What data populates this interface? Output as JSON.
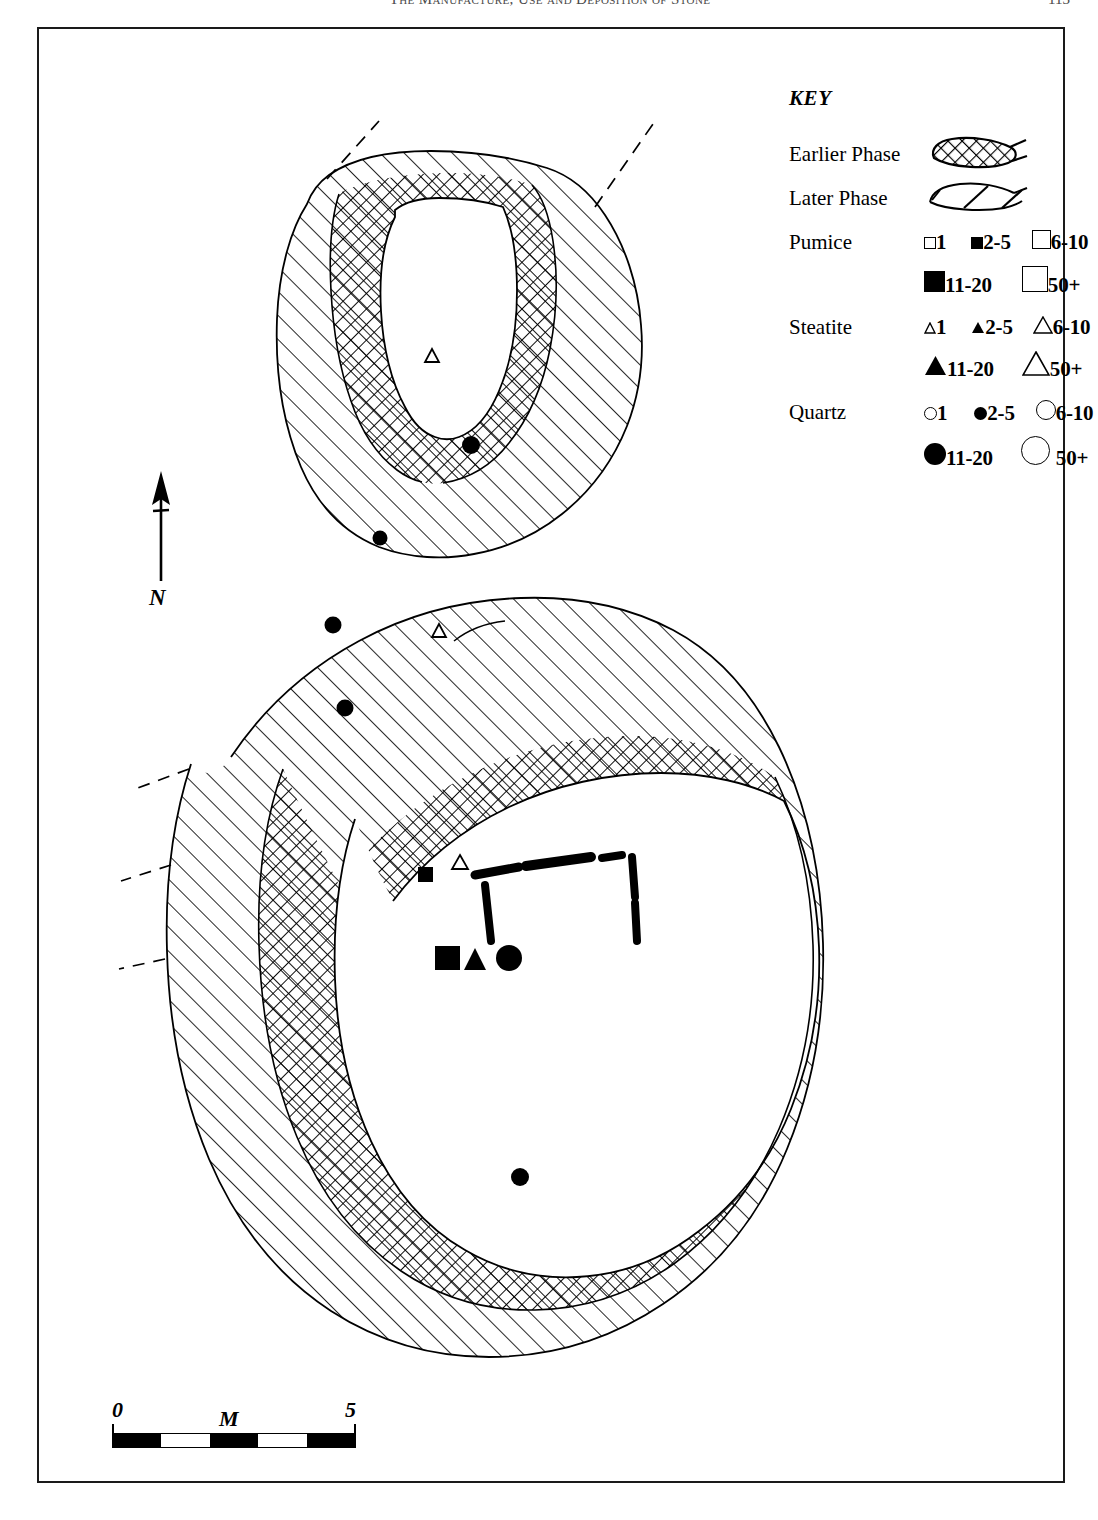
{
  "running_head": {
    "title": "The Manufacture, Use and Deposition of Stone",
    "folio": "113"
  },
  "key": {
    "title": "KEY",
    "rows": [
      {
        "label": "Earlier Phase",
        "swatch": "crosshatch-lens",
        "items": []
      },
      {
        "label": "Later Phase",
        "swatch": "diagonal-lens",
        "items": []
      },
      {
        "label": "Pumice",
        "shape": "square",
        "items": [
          {
            "marker": "square-open-tiny",
            "text": "1"
          },
          {
            "marker": "square-fill-small",
            "text": "2-5"
          },
          {
            "marker": "square-open-medium",
            "text": "6-10"
          },
          {
            "marker": "square-fill-large",
            "text": "11-20"
          },
          {
            "marker": "square-open-large",
            "text": "50+"
          }
        ]
      },
      {
        "label": "Steatite",
        "shape": "triangle",
        "items": [
          {
            "marker": "triangle-open-tiny",
            "text": "1"
          },
          {
            "marker": "triangle-fill-small",
            "text": "2-5"
          },
          {
            "marker": "triangle-open-medium",
            "text": "6-10"
          },
          {
            "marker": "triangle-fill-large",
            "text": "11-20"
          },
          {
            "marker": "triangle-open-large",
            "text": "50+"
          }
        ]
      },
      {
        "label": "Quartz",
        "shape": "circle",
        "items": [
          {
            "marker": "circle-open-tiny",
            "text": "1"
          },
          {
            "marker": "circle-fill-small",
            "text": "2-5"
          },
          {
            "marker": "circle-open-medium",
            "text": "6-10"
          },
          {
            "marker": "circle-fill-large",
            "text": "11-20"
          },
          {
            "marker": "circle-open-large",
            "text": "50+"
          }
        ]
      }
    ]
  },
  "north_arrow": {
    "label": "N"
  },
  "scale_bar": {
    "start_label": "0",
    "unit_label": "M",
    "end_label": "5",
    "segments": [
      "dark",
      "light",
      "dark",
      "light",
      "dark"
    ]
  },
  "plan": {
    "structures": [
      {
        "name": "upper-structure",
        "phases": [
          "Later Phase",
          "Earlier Phase"
        ]
      },
      {
        "name": "lower-structure",
        "phases": [
          "Later Phase",
          "Earlier Phase"
        ]
      }
    ],
    "finds": [
      {
        "id": "f1",
        "material": "Steatite",
        "count": "1",
        "marker": "triangle-open-tiny",
        "structure": "upper-structure",
        "x": 393,
        "y": 327
      },
      {
        "id": "f2",
        "material": "Quartz",
        "count": "11-20",
        "marker": "circle-fill-large",
        "structure": "upper-structure",
        "x": 432,
        "y": 416
      },
      {
        "id": "f3",
        "material": "Quartz",
        "count": "11-20",
        "marker": "circle-fill-large",
        "structure": "upper-structure",
        "x": 341,
        "y": 509
      },
      {
        "id": "f4",
        "material": "Quartz",
        "count": "11-20",
        "marker": "circle-fill-large",
        "structure": "lower-structure",
        "x": 294,
        "y": 596
      },
      {
        "id": "f5",
        "material": "Steatite",
        "count": "1",
        "marker": "triangle-open-tiny",
        "structure": "lower-structure",
        "x": 400,
        "y": 602
      },
      {
        "id": "f6",
        "material": "Quartz",
        "count": "11-20",
        "marker": "circle-fill-large",
        "structure": "lower-structure",
        "x": 306,
        "y": 679
      },
      {
        "id": "f7",
        "material": "Pumice",
        "count": "2-5",
        "marker": "square-fill-small",
        "structure": "lower-structure",
        "x": 386,
        "y": 845
      },
      {
        "id": "f8",
        "material": "Steatite",
        "count": "1",
        "marker": "triangle-open-tiny",
        "structure": "lower-structure",
        "x": 421,
        "y": 833
      },
      {
        "id": "f9",
        "material": "Pumice",
        "count": "11-20",
        "marker": "square-fill-large",
        "structure": "lower-structure",
        "x": 409,
        "y": 929
      },
      {
        "id": "f10",
        "material": "Steatite",
        "count": "2-5",
        "marker": "triangle-fill-small",
        "structure": "lower-structure",
        "x": 436,
        "y": 931
      },
      {
        "id": "f11",
        "material": "Quartz",
        "count": "11-20",
        "marker": "circle-fill-large",
        "structure": "lower-structure",
        "x": 470,
        "y": 929
      },
      {
        "id": "f12",
        "material": "Quartz",
        "count": "11-20",
        "marker": "circle-fill-large",
        "structure": "lower-structure",
        "x": 481,
        "y": 1148
      }
    ],
    "central_feature": {
      "name": "stone-box-hearth",
      "slabs": 5
    }
  }
}
